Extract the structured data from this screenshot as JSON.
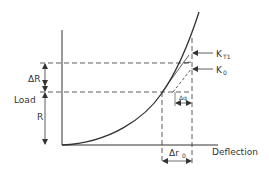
{
  "diagram": {
    "type": "load-deflection curve",
    "colors": {
      "line": "#333333",
      "background": "#ffffff"
    },
    "axes": {
      "x_label": "Deflection",
      "y_label": "Load"
    },
    "labels": {
      "delta_R": "ΔR",
      "R": "R",
      "K_T1": "K",
      "K_T1_sub": "T1",
      "K_0": "K",
      "K_0_sub": "0",
      "delta_q": "Δq",
      "delta_r0": "Δr",
      "delta_r0_sub": "0"
    }
  }
}
